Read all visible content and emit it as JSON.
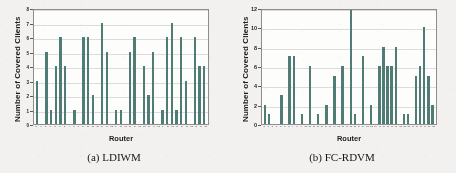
{
  "figure": {
    "panels": [
      {
        "id": "panel-a",
        "caption": "(a) LDIWM",
        "ylabel": "Number of Covered Clients",
        "xlabel": "Router"
      },
      {
        "id": "panel-b",
        "caption": "(b) FC-RDVM",
        "ylabel": "Number of Covered Clients",
        "xlabel": "Router"
      }
    ]
  },
  "colors": {
    "bar": "#4f7d75",
    "plot_background": "#fdfdfc",
    "gridline": "#dcdcdc",
    "axis": "#8d8d8d",
    "page_background": "#f2f1ef",
    "text": "#1d1d1d"
  },
  "chart_data": [
    {
      "type": "bar",
      "title": "(a) LDIWM",
      "xlabel": "Router",
      "ylabel": "Number of Covered Clients",
      "ylim": [
        0,
        8
      ],
      "yticks": [
        0,
        1,
        2,
        3,
        4,
        5,
        6,
        7,
        8
      ],
      "ytick_labels": [
        "0",
        "1",
        "2",
        "3",
        "4",
        "5",
        "6",
        "7",
        "8"
      ],
      "grid": true,
      "legend": null,
      "categories": [
        "0",
        "1",
        "2",
        "3",
        "4",
        "5",
        "6",
        "7",
        "8",
        "9",
        "10",
        "11",
        "12",
        "13",
        "14",
        "15",
        "16",
        "17",
        "18",
        "19",
        "20",
        "21",
        "22",
        "23",
        "24",
        "25",
        "26",
        "27",
        "28",
        "29",
        "30",
        "31",
        "32",
        "33",
        "34",
        "35",
        "36"
      ],
      "values": [
        3,
        0,
        5,
        1,
        4,
        6,
        4,
        0,
        1,
        0,
        6,
        6,
        2,
        0,
        7,
        5,
        0,
        1,
        1,
        0,
        5,
        6,
        0,
        4,
        2,
        5,
        0,
        1,
        6,
        7,
        1,
        6,
        3,
        0,
        6,
        4,
        4
      ]
    },
    {
      "type": "bar",
      "title": "(b) FC-RDVM",
      "xlabel": "Router",
      "ylabel": "Number of Covered Clients",
      "ylim": [
        0,
        12
      ],
      "yticks": [
        0,
        2,
        4,
        6,
        8,
        10,
        12
      ],
      "ytick_labels": [
        "0",
        "2",
        "4",
        "6",
        "8",
        "10",
        "12"
      ],
      "grid": true,
      "legend": null,
      "categories": [
        "0",
        "1",
        "2",
        "3",
        "4",
        "5",
        "6",
        "7",
        "8",
        "9",
        "10",
        "11",
        "12",
        "13",
        "14",
        "15",
        "16",
        "17",
        "18",
        "19",
        "20",
        "21",
        "22",
        "23",
        "24",
        "25",
        "26",
        "27",
        "28",
        "29",
        "30",
        "31",
        "32",
        "33",
        "34",
        "35",
        "36",
        "37",
        "38",
        "39",
        "40",
        "41"
      ],
      "values": [
        2,
        1,
        0,
        0,
        3,
        0,
        7,
        7,
        0,
        1,
        0,
        6,
        0,
        1,
        0,
        2,
        0,
        5,
        0,
        6,
        0,
        12,
        1,
        0,
        7,
        0,
        2,
        0,
        6,
        8,
        6,
        6,
        8,
        0,
        1,
        1,
        0,
        5,
        6,
        10,
        5,
        2
      ]
    }
  ]
}
